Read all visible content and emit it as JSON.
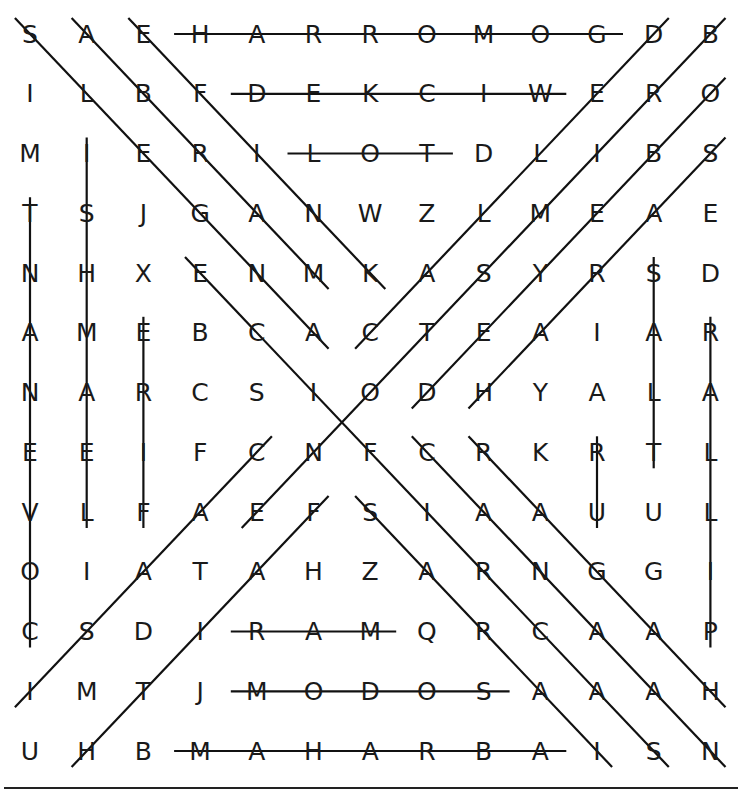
{
  "puzzle": {
    "title": "",
    "rows": 13,
    "cols": 13,
    "grid": [
      [
        "S",
        "A",
        "E",
        "H",
        "A",
        "R",
        "R",
        "O",
        "M",
        "O",
        "G",
        "D",
        "B"
      ],
      [
        "I",
        "L",
        "B",
        "F",
        "D",
        "E",
        "K",
        "C",
        "I",
        "W",
        "E",
        "R",
        "O"
      ],
      [
        "M",
        "I",
        "E",
        "R",
        "I",
        "L",
        "O",
        "T",
        "D",
        "L",
        "I",
        "B",
        "S"
      ],
      [
        "T",
        "S",
        "J",
        "G",
        "A",
        "N",
        "W",
        "Z",
        "L",
        "M",
        "E",
        "A",
        "E"
      ],
      [
        "N",
        "H",
        "X",
        "E",
        "N",
        "M",
        "K",
        "A",
        "S",
        "Y",
        "R",
        "S",
        "D"
      ],
      [
        "A",
        "M",
        "E",
        "B",
        "C",
        "A",
        "C",
        "T",
        "E",
        "A",
        "I",
        "A",
        "R"
      ],
      [
        "N",
        "A",
        "R",
        "C",
        "S",
        "I",
        "O",
        "D",
        "H",
        "Y",
        "A",
        "L",
        "A"
      ],
      [
        "E",
        "E",
        "I",
        "F",
        "C",
        "N",
        "F",
        "C",
        "R",
        "K",
        "R",
        "T",
        "L"
      ],
      [
        "V",
        "L",
        "F",
        "A",
        "E",
        "F",
        "S",
        "I",
        "A",
        "A",
        "U",
        "U",
        "L"
      ],
      [
        "O",
        "I",
        "A",
        "T",
        "A",
        "H",
        "Z",
        "A",
        "R",
        "N",
        "G",
        "G",
        "I"
      ],
      [
        "C",
        "S",
        "D",
        "I",
        "R",
        "A",
        "M",
        "Q",
        "R",
        "C",
        "A",
        "A",
        "P"
      ],
      [
        "I",
        "M",
        "T",
        "J",
        "M",
        "O",
        "D",
        "O",
        "S",
        "A",
        "A",
        "A",
        "H"
      ],
      [
        "U",
        "H",
        "B",
        "M",
        "A",
        "H",
        "A",
        "R",
        "B",
        "A",
        "I",
        "S",
        "N"
      ]
    ],
    "found_words": [
      {
        "word": "GOMORRAH",
        "start": [
          10,
          0
        ],
        "end": [
          3,
          0
        ],
        "direction": "horizontal"
      },
      {
        "word": "WICKED",
        "start": [
          9,
          1
        ],
        "end": [
          4,
          1
        ],
        "direction": "horizontal"
      },
      {
        "word": "LOT",
        "start": [
          5,
          2
        ],
        "end": [
          7,
          2
        ],
        "direction": "horizontal"
      },
      {
        "word": "RAM",
        "start": [
          4,
          10
        ],
        "end": [
          6,
          10
        ],
        "direction": "horizontal"
      },
      {
        "word": "SODOM",
        "start": [
          8,
          11
        ],
        "end": [
          4,
          11
        ],
        "direction": "horizontal"
      },
      {
        "word": "ABRAHAM",
        "start": [
          9,
          12
        ],
        "end": [
          3,
          12
        ],
        "direction": "horizontal"
      },
      {
        "word": "COVENANT",
        "start": [
          0,
          10
        ],
        "end": [
          0,
          3
        ],
        "direction": "vertical"
      },
      {
        "word": "ISHMAEL",
        "start": [
          1,
          2
        ],
        "end": [
          1,
          8
        ],
        "direction": "vertical"
      },
      {
        "word": "FIRE",
        "start": [
          2,
          8
        ],
        "end": [
          2,
          5
        ],
        "direction": "vertical"
      },
      {
        "word": "UR",
        "start": [
          10,
          8
        ],
        "end": [
          10,
          7
        ],
        "direction": "vertical"
      },
      {
        "word": "SALT",
        "start": [
          11,
          4
        ],
        "end": [
          11,
          7
        ],
        "direction": "vertical"
      },
      {
        "word": "PILLAR",
        "start": [
          12,
          10
        ],
        "end": [
          12,
          5
        ],
        "direction": "vertical"
      },
      {
        "word": "ANGELS",
        "start": [
          5,
          5
        ],
        "end": [
          0,
          0
        ],
        "direction": "diagonal"
      },
      {
        "word": "ABRAM",
        "start": [
          1,
          0
        ],
        "end": [
          5,
          4
        ],
        "direction": "diagonal"
      },
      {
        "word": "KNIFE",
        "start": [
          6,
          4
        ],
        "end": [
          2,
          0
        ],
        "direction": "diagonal"
      },
      {
        "word": "SACRIFICE",
        "start": [
          11,
          12
        ],
        "end": [
          3,
          4
        ],
        "direction": "diagonal"
      },
      {
        "word": "SARAI",
        "start": [
          6,
          8
        ],
        "end": [
          10,
          12
        ],
        "direction": "diagonal"
      },
      {
        "word": "CANAAN",
        "start": [
          7,
          7
        ],
        "end": [
          12,
          12
        ],
        "direction": "diagonal"
      },
      {
        "word": "HAGAR",
        "start": [
          12,
          11
        ],
        "end": [
          8,
          7
        ],
        "direction": "diagonal"
      },
      {
        "word": "CALLED",
        "start": [
          6,
          5
        ],
        "end": [
          11,
          0
        ],
        "direction": "diagonal"
      },
      {
        "word": "BRIMSTONE",
        "start": [
          12,
          0
        ],
        "end": [
          4,
          8
        ],
        "direction": "diagonal"
      },
      {
        "word": "OBEYED",
        "start": [
          12,
          1
        ],
        "end": [
          7,
          6
        ],
        "direction": "diagonal"
      },
      {
        "word": "SARAH",
        "start": [
          12,
          2
        ],
        "end": [
          8,
          6
        ],
        "direction": "diagonal"
      },
      {
        "word": "ISAAC",
        "start": [
          0,
          11
        ],
        "end": [
          4,
          7
        ],
        "direction": "diagonal"
      },
      {
        "word": "FAITH",
        "start": [
          5,
          8
        ],
        "end": [
          1,
          12
        ],
        "direction": "diagonal"
      }
    ],
    "colors": {
      "letter": "#1a1a1a",
      "line": "#111111",
      "background": "#ffffff"
    }
  }
}
